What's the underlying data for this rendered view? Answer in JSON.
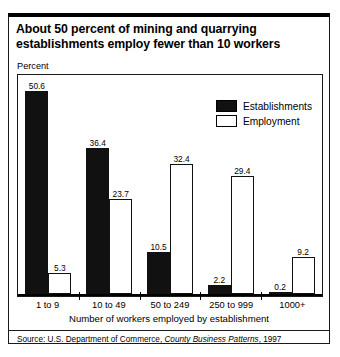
{
  "title": "About 50 percent of mining and quarrying establishments employ fewer than 10 workers",
  "axis_unit": "Percent",
  "source": {
    "prefix": "Source: U.S. Department of Commerce, ",
    "publication": "County Business Patterns",
    "suffix": ", 1997"
  },
  "colors": {
    "establishments": "#111111",
    "employment": "#ffffff",
    "outline": "#000000",
    "background": "#ffffff"
  },
  "chart_data": {
    "type": "bar",
    "title": "About 50 percent of mining and quarrying establishments employ fewer than 10 workers",
    "xlabel": "Number of workers employed by establishment",
    "ylabel": "Percent",
    "ylim": [
      0,
      55
    ],
    "grid": false,
    "legend_position": "top-right",
    "categories": [
      "1 to 9",
      "10 to 49",
      "50 to 249",
      "250 to 999",
      "1000+"
    ],
    "series": [
      {
        "name": "Establishments",
        "values": [
          50.6,
          36.4,
          10.5,
          2.2,
          0.2
        ]
      },
      {
        "name": "Employment",
        "values": [
          5.3,
          23.7,
          32.4,
          29.4,
          9.2
        ]
      }
    ]
  }
}
